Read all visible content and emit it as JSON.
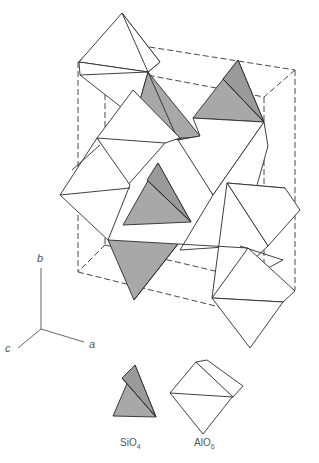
{
  "figure": {
    "colors": {
      "tetrahedron_fill": "#a8a8a8",
      "octahedron_fill": "#ffffff",
      "line": "#2a2a2a"
    }
  },
  "axes": {
    "b": "b",
    "a": "a",
    "c": "c"
  },
  "legend": {
    "items": [
      {
        "name": "SiO4",
        "base": "SiO",
        "sub": "4",
        "shape": "tetrahedron",
        "fill": "#a8a8a8"
      },
      {
        "name": "AlO6",
        "base": "AlO",
        "sub": "6",
        "shape": "octahedron",
        "fill": "#ffffff"
      }
    ]
  }
}
